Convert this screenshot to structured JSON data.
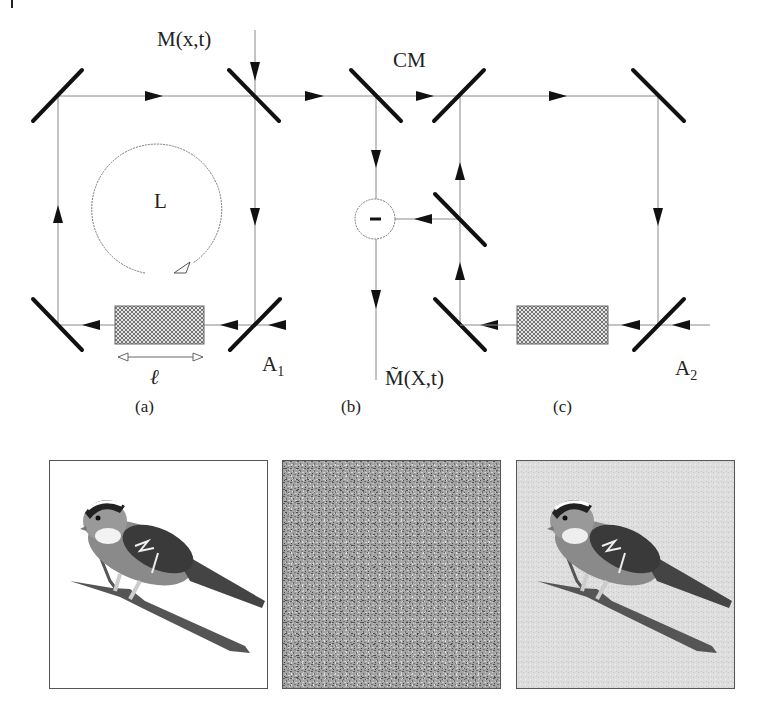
{
  "figure": {
    "header_mark": "|",
    "labels": {
      "input_signal": "M(x,t)",
      "loop": "L",
      "length": "ℓ",
      "amplifier_1": "A",
      "amplifier_1_sub": "1",
      "amplifier_2": "A",
      "amplifier_2_sub": "2",
      "coupling_mirror": "CM",
      "subtractor": "−",
      "output_signal": "M̃(X,t)"
    },
    "captions": [
      "(a)",
      "(b)",
      "(c)"
    ],
    "panels": [
      {
        "name": "original-bird-image",
        "description": "bird on branch, white background"
      },
      {
        "name": "noise-image",
        "description": "random gray noise"
      },
      {
        "name": "recovered-bird-image",
        "description": "bird on branch, light noisy background"
      }
    ],
    "colors": {
      "line": "#888888",
      "mirror": "#111111",
      "gain_medium": "#cccccc",
      "noise_bg": "#9a9a9a",
      "recovered_bg": "#dcdcdc"
    }
  }
}
